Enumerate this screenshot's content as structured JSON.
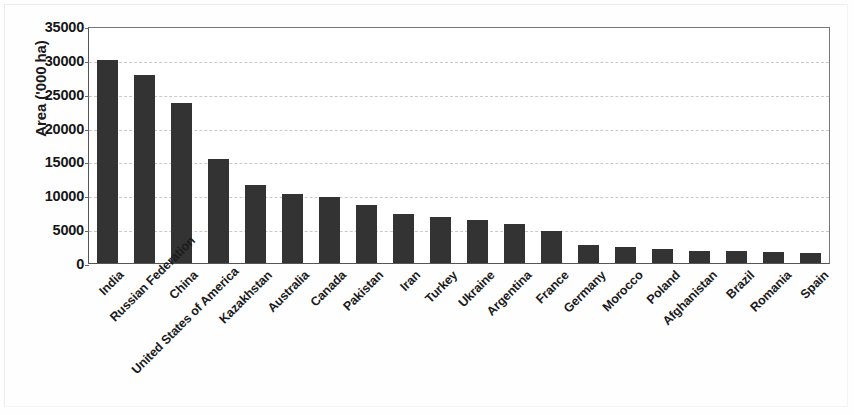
{
  "chart_data": {
    "type": "bar",
    "title": "",
    "xlabel": "",
    "ylabel": "Area ('000 ha)",
    "ylim": [
      0,
      35000
    ],
    "yticks": [
      0,
      5000,
      10000,
      15000,
      20000,
      25000,
      30000,
      35000
    ],
    "ytick_labels": [
      "0",
      "5000",
      "10000",
      "15000",
      "20000",
      "25000",
      "30000",
      "35000"
    ],
    "grid": true,
    "legend": null,
    "bar_color": "#333333",
    "categories": [
      "India",
      "Russian Federation",
      "China",
      "United States of America",
      "Kazakhstan",
      "Australia",
      "Canada",
      "Pakistan",
      "Iran",
      "Turkey",
      "Ukraine",
      "Argentina",
      "France",
      "Germany",
      "Morocco",
      "Poland",
      "Afghanistan",
      "Brazil",
      "Romania",
      "Spain"
    ],
    "values": [
      30000,
      27700,
      23700,
      15300,
      11500,
      10200,
      9700,
      8600,
      7300,
      6800,
      6300,
      5800,
      4800,
      2600,
      2400,
      2050,
      1800,
      1750,
      1700,
      1450
    ]
  }
}
